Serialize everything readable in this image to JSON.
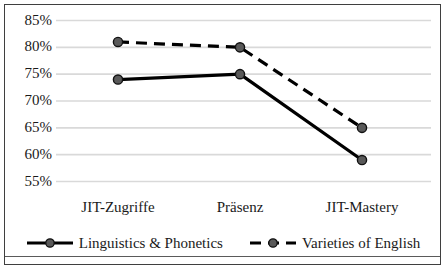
{
  "chart_data": {
    "type": "line",
    "title": "",
    "xlabel": "",
    "ylabel": "",
    "categories": [
      "JIT-Zugriffe",
      "Präsenz",
      "JIT-Mastery"
    ],
    "series": [
      {
        "name": "Linguistics & Phonetics",
        "values": [
          74,
          75,
          59
        ],
        "style": "solid",
        "marker": "circle",
        "color": "#000000",
        "marker_fill": "#595959"
      },
      {
        "name": "Varieties of English",
        "values": [
          81,
          80,
          65
        ],
        "style": "dashed",
        "marker": "circle",
        "color": "#000000",
        "marker_fill": "#595959"
      }
    ],
    "ylim": [
      55,
      85
    ],
    "ytick_values": [
      85,
      80,
      75,
      70,
      65,
      60,
      55
    ],
    "ytick_labels": [
      "85%",
      "80%",
      "75%",
      "70%",
      "65%",
      "60%",
      "55%"
    ],
    "grid": true,
    "grid_color": "#d9d9d9",
    "legend_position": "bottom",
    "value_suffix": "%"
  },
  "axis": {
    "y_labels": [
      "85%",
      "80%",
      "75%",
      "70%",
      "65%",
      "60%",
      "55%"
    ],
    "x_labels": [
      "JIT-Zugriffe",
      "Präsenz",
      "JIT-Mastery"
    ]
  },
  "legend": {
    "entries": [
      {
        "label": "Linguistics & Phonetics"
      },
      {
        "label": "Varieties of English"
      }
    ]
  }
}
